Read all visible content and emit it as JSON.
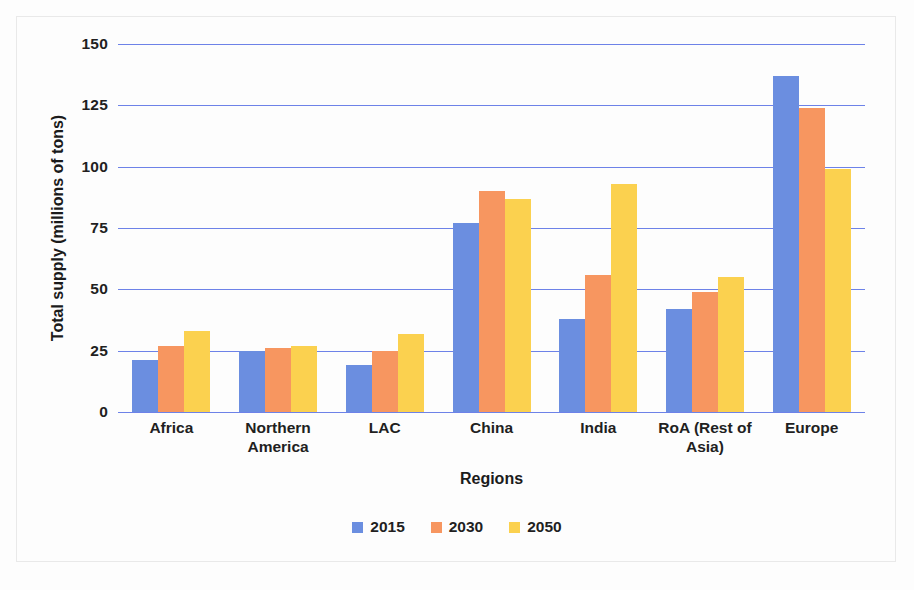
{
  "chart_data": {
    "type": "bar",
    "title": "",
    "xlabel": "Regions",
    "ylabel": "Total supply (millions of tons)",
    "categories": [
      "Africa",
      "Northern America",
      "LAC",
      "China",
      "India",
      "RoA (Rest of Asia)",
      "Europe"
    ],
    "series": [
      {
        "name": "2015",
        "color": "#6b8ee0",
        "values": [
          21,
          25,
          19,
          77,
          38,
          42,
          137
        ]
      },
      {
        "name": "2030",
        "color": "#f79660",
        "values": [
          27,
          26,
          25,
          90,
          56,
          49,
          124
        ]
      },
      {
        "name": "2050",
        "color": "#fbd14f",
        "values": [
          33,
          27,
          32,
          87,
          93,
          55,
          99
        ]
      }
    ],
    "ylim": [
      0,
      150
    ],
    "yticks": [
      0,
      25,
      50,
      75,
      100,
      125,
      150
    ],
    "ytick_labels": [
      "0",
      "25",
      "50",
      "75",
      "100",
      "125",
      "150"
    ],
    "grid": true,
    "gridline_color": "#6d82e8",
    "legend_position": "bottom"
  },
  "legend": {
    "items": [
      {
        "label": "2015",
        "color": "#6b8ee0"
      },
      {
        "label": "2030",
        "color": "#f79660"
      },
      {
        "label": "2050",
        "color": "#fbd14f"
      }
    ]
  }
}
